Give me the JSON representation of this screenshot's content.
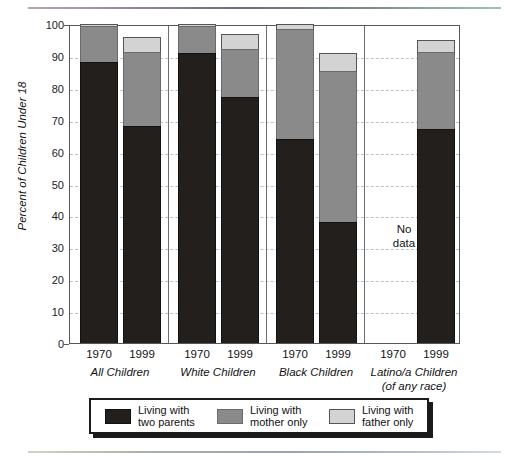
{
  "chart_data": {
    "type": "bar",
    "subtype": "stacked-bar-100",
    "title": "",
    "xlabel": "",
    "ylabel": "Percent of Children Under 18",
    "ylim": [
      0,
      100
    ],
    "ytick_step": 10,
    "yticks": [
      "100",
      "90",
      "80",
      "70",
      "60",
      "50",
      "40",
      "30",
      "20",
      "10",
      "0"
    ],
    "grid": true,
    "legend_position": "bottom",
    "categories": [
      "1970",
      "1999",
      "1970",
      "1999",
      "1970",
      "1999",
      "1970",
      "1999"
    ],
    "groups": [
      {
        "label": "All Children",
        "sublabel": "",
        "bars": [
          {
            "year": "1970",
            "two_parents": 88,
            "mother_only": 11,
            "father_only": 1,
            "no_data": false
          },
          {
            "year": "1999",
            "two_parents": 68,
            "mother_only": 23,
            "father_only": 5,
            "no_data": false
          }
        ]
      },
      {
        "label": "White Children",
        "sublabel": "",
        "bars": [
          {
            "year": "1970",
            "two_parents": 91,
            "mother_only": 8,
            "father_only": 1,
            "no_data": false
          },
          {
            "year": "1999",
            "two_parents": 77,
            "mother_only": 15,
            "father_only": 5,
            "no_data": false
          }
        ]
      },
      {
        "label": "Black Children",
        "sublabel": "",
        "bars": [
          {
            "year": "1970",
            "two_parents": 64,
            "mother_only": 34,
            "father_only": 2,
            "no_data": false
          },
          {
            "year": "1999",
            "two_parents": 38,
            "mother_only": 47,
            "father_only": 6,
            "no_data": false
          }
        ]
      },
      {
        "label": "Latino/a Children",
        "sublabel": "(of any race)",
        "bars": [
          {
            "year": "1970",
            "two_parents": 0,
            "mother_only": 0,
            "father_only": 0,
            "no_data": true
          },
          {
            "year": "1999",
            "two_parents": 67,
            "mother_only": 24,
            "father_only": 4,
            "no_data": false
          }
        ]
      }
    ],
    "series": [
      {
        "name": "Living with two parents",
        "key": "two_parents",
        "color": "#231f1c",
        "values": [
          88,
          68,
          91,
          77,
          64,
          38,
          null,
          67
        ]
      },
      {
        "name": "Living with mother only",
        "key": "mother_only",
        "color": "#8a8a8a",
        "values": [
          11,
          23,
          8,
          15,
          34,
          47,
          null,
          24
        ]
      },
      {
        "name": "Living with father only",
        "key": "father_only",
        "color": "#d3d3d3",
        "values": [
          1,
          5,
          1,
          5,
          2,
          6,
          null,
          4
        ]
      }
    ],
    "annotations": [
      {
        "text": "No data",
        "group": "Latino/a Children",
        "year": "1970"
      }
    ]
  },
  "legend": {
    "items": [
      {
        "label": "Living with\ntwo parents",
        "color": "#231f1c",
        "swatch": "two"
      },
      {
        "label": "Living with\nmother only",
        "color": "#8a8a8a",
        "swatch": "mother"
      },
      {
        "label": "Living with\nfather only",
        "color": "#d3d3d3",
        "swatch": "father"
      }
    ]
  },
  "annotation": {
    "no_data_line1": "No",
    "no_data_line2": "data"
  },
  "axis": {
    "y_title": "Percent of Children Under 18"
  }
}
